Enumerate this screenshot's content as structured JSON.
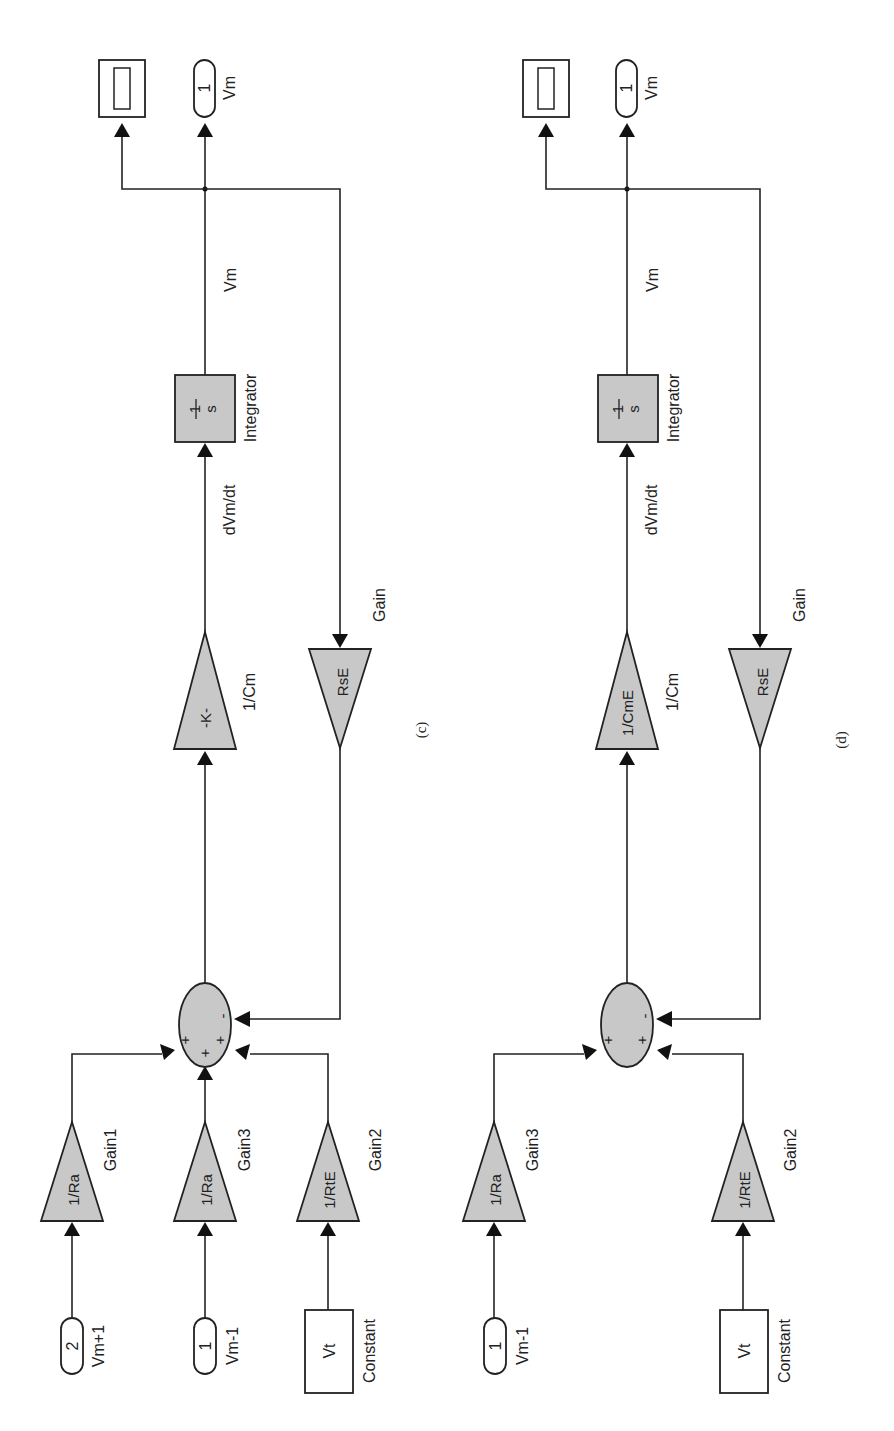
{
  "figure": {
    "orientation": "rotated-90-ccw",
    "colors": {
      "block_fill": "#c8c8c8",
      "line": "#222222",
      "background": "#ffffff"
    },
    "diagrams": [
      {
        "caption": "(c)",
        "inports": [
          {
            "number": "2",
            "name": "Vm+1"
          },
          {
            "number": "1",
            "name": "Vm-1"
          }
        ],
        "constant": {
          "value": "Vt",
          "name": "Constant"
        },
        "gains": {
          "gain1": {
            "value": "1/Ra",
            "name": "Gain1"
          },
          "gain3": {
            "value": "1/Ra",
            "name": "Gain3"
          },
          "gain2": {
            "value": "1/RtE",
            "name": "Gain2"
          },
          "cm": {
            "value": "-K-",
            "name": "1/Cm"
          },
          "feedback": {
            "value": "RsE",
            "name": "Gain"
          }
        },
        "sum": {
          "signs": [
            "+",
            "+",
            "+",
            "-"
          ]
        },
        "signals": {
          "derivative": "dVm/dt",
          "output": "Vm"
        },
        "integrator": {
          "num": "1",
          "den": "s",
          "name": "Integrator"
        },
        "outport": {
          "number": "1",
          "name": "Vm"
        },
        "scope": {
          "name": "Scope"
        }
      },
      {
        "caption": "(d)",
        "inports": [
          {
            "number": "1",
            "name": "Vm-1"
          }
        ],
        "constant": {
          "value": "Vt",
          "name": "Constant"
        },
        "gains": {
          "gain3": {
            "value": "1/Ra",
            "name": "Gain3"
          },
          "gain2": {
            "value": "1/RtE",
            "name": "Gain2"
          },
          "cm": {
            "value": "1/CmE",
            "name": "1/Cm"
          },
          "feedback": {
            "value": "RsE",
            "name": "Gain"
          }
        },
        "sum": {
          "signs": [
            "+",
            "+",
            "-"
          ]
        },
        "signals": {
          "derivative": "dVm/dt",
          "output": "Vm"
        },
        "integrator": {
          "num": "1",
          "den": "s",
          "name": "Integrator"
        },
        "outport": {
          "number": "1",
          "name": "Vm"
        },
        "scope": {
          "name": "Scope"
        }
      }
    ]
  }
}
